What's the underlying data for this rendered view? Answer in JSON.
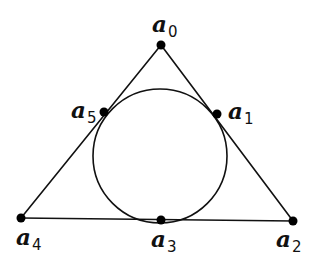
{
  "diagram": {
    "colors": {
      "stroke": "#111111",
      "dot": "#000000",
      "background": "#ffffff"
    },
    "triangle": {
      "vertices": [
        "a0",
        "a2",
        "a4"
      ]
    },
    "incircle": {
      "cx": 160,
      "cy": 156,
      "r": 67,
      "tangent_points": [
        "a1",
        "a3",
        "a5"
      ]
    },
    "points": [
      {
        "id": "a0",
        "letter": "a",
        "index": "0",
        "x": 161,
        "y": 45,
        "label_x": 152,
        "label_y": 12
      },
      {
        "id": "a1",
        "letter": "a",
        "index": "1",
        "x": 217,
        "y": 114,
        "label_x": 228,
        "label_y": 99
      },
      {
        "id": "a2",
        "letter": "a",
        "index": "2",
        "x": 293,
        "y": 221,
        "label_x": 276,
        "label_y": 227
      },
      {
        "id": "a3",
        "letter": "a",
        "index": "3",
        "x": 161,
        "y": 220,
        "label_x": 151,
        "label_y": 227
      },
      {
        "id": "a4",
        "letter": "a",
        "index": "4",
        "x": 21,
        "y": 218,
        "label_x": 16,
        "label_y": 225
      },
      {
        "id": "a5",
        "letter": "a",
        "index": "5",
        "x": 104,
        "y": 112,
        "label_x": 71,
        "label_y": 98
      }
    ]
  }
}
